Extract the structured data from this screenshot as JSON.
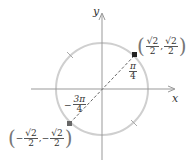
{
  "diagram": {
    "axes": {
      "x_label": "x",
      "y_label": "y"
    },
    "circle": {
      "center": [
        102,
        89
      ],
      "radius": 46,
      "color": "#cfcfcf"
    },
    "points": [
      {
        "name": "first-quadrant-point",
        "label_num1": "√2",
        "label_den1": "2",
        "label_num2": "√2",
        "label_den2": "2",
        "sign1": "",
        "sign2": "",
        "angle_num": "π",
        "angle_den": "4",
        "angle_sign": ""
      },
      {
        "name": "third-quadrant-point",
        "label_num1": "√2",
        "label_den1": "2",
        "label_num2": "√2",
        "label_den2": "2",
        "sign1": "−",
        "sign2": "−",
        "angle_num": "3π",
        "angle_den": "4",
        "angle_sign": "−"
      }
    ],
    "comma": ","
  }
}
